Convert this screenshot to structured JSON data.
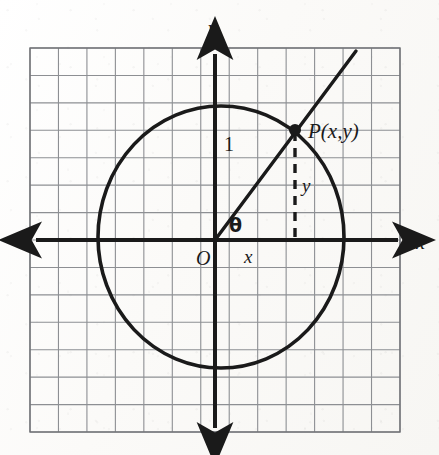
{
  "figure": {
    "kind": "unit-circle-trigonometry-diagram",
    "colors": {
      "ink": "#1a1a1a",
      "grid_line": "#8d8f93",
      "grid_border": "#6f7175",
      "paper": "#fbfaf8"
    }
  },
  "grid": {
    "columns": 13,
    "rows": 14,
    "left": 30,
    "top": 48,
    "right": 400,
    "bottom": 432,
    "cell_width": 28.46,
    "cell_height": 27.43
  },
  "axes": {
    "x_axis": {
      "label": "x",
      "label_x": 416,
      "label_y": 232,
      "y": 240,
      "start_x": 36,
      "end_x": 398
    },
    "y_axis": {
      "label": "y",
      "label_x": 208,
      "label_y": 18,
      "x": 215,
      "start_y": 54,
      "end_y": 428
    },
    "origin": {
      "label": "O",
      "x": 215,
      "y": 240,
      "label_x": 196,
      "label_y": 248
    }
  },
  "circle": {
    "center_x": 221,
    "center_y": 237,
    "radius_x": 123,
    "radius_y": 131,
    "stroke_width": 3.6
  },
  "ray": {
    "from_x": 215,
    "from_y": 240,
    "to_x": 356,
    "to_y": 51,
    "stroke_width": 3.4
  },
  "point_p": {
    "label": "P(x,y)",
    "x": 295,
    "y": 130,
    "dot_radius": 6,
    "label_x": 308,
    "label_y": 121
  },
  "dashed_segment": {
    "label": "y",
    "from_x": 295,
    "from_y": 132,
    "to_x": 295,
    "to_y": 240,
    "dash_pattern": "9 7",
    "stroke_width": 3.4,
    "label_x": 302,
    "label_y": 176
  },
  "labels": {
    "radius_label": {
      "text": "1",
      "x": 224,
      "y": 134
    },
    "angle_label": {
      "text": "θ",
      "x": 229,
      "y": 216
    },
    "x_component": {
      "text": "x",
      "x": 244,
      "y": 247
    }
  }
}
